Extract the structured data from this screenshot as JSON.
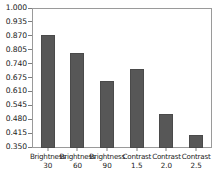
{
  "chart_data": {
    "type": "bar",
    "title": "",
    "xlabel": "",
    "ylabel": "",
    "categories": [
      "Brightness",
      "Brightness",
      "Brightness",
      "Contrast",
      "Contrast",
      "Contrast"
    ],
    "category_values": [
      "30",
      "60",
      "90",
      "1.5",
      "2.0",
      "2.5"
    ],
    "tick_labels": [
      "Brightness\n30",
      "Brightness\n60",
      "Brightness\n90",
      "Contrast\n1.5",
      "Contrast\n2.0",
      "Contrast\n2.5"
    ],
    "values": [
      0.88,
      0.795,
      0.662,
      0.718,
      0.51,
      0.412
    ],
    "ylim": [
      0.35,
      1.0
    ],
    "yticks": [
      0.35,
      0.415,
      0.48,
      0.545,
      0.61,
      0.675,
      0.74,
      0.805,
      0.87,
      0.935,
      1.0
    ],
    "ytick_labels": [
      "0.350",
      "0.415",
      "0.480",
      "0.545",
      "0.610",
      "0.675",
      "0.740",
      "0.805",
      "0.870",
      "0.935",
      "1.000"
    ],
    "grid": false,
    "legend": null,
    "legend_position": "none",
    "bar_color": "#575757",
    "bar_edge_color": "#4a4a4a",
    "frame_color": "#9a9a9a",
    "text_color": "#1a1a1a",
    "background_color": "#ffffff"
  }
}
